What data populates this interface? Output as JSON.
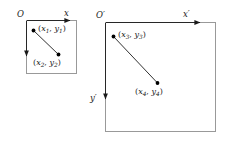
{
  "diagram": {
    "type": "geometry-coordinate-systems",
    "background_color": "#ffffff",
    "stroke_color": "#808080",
    "line_color": "#1a1a1a",
    "point_color": "#000000",
    "frames": [
      {
        "id": "left-frame",
        "origin_label": "O",
        "x_axis_label": "x",
        "y_axis_label": "",
        "points": [
          {
            "id": "p1",
            "label_open": "(",
            "label_x": "x",
            "label_x_sub": "1",
            "label_comma": ", ",
            "label_y": "y",
            "label_y_sub": "1",
            "label_close": ")"
          },
          {
            "id": "p2",
            "label_open": "(",
            "label_x": "x",
            "label_x_sub": "2",
            "label_comma": ", ",
            "label_y": "y",
            "label_y_sub": "2",
            "label_close": ")"
          }
        ]
      },
      {
        "id": "right-frame",
        "origin_label": "O",
        "origin_prime": "′",
        "x_axis_label": "x",
        "x_axis_prime": "′",
        "y_axis_label": "y",
        "y_axis_prime": "′",
        "points": [
          {
            "id": "p3",
            "label_open": "(",
            "label_x": "x",
            "label_x_sub": "3",
            "label_comma": ", ",
            "label_y": "y",
            "label_y_sub": "3",
            "label_close": ")"
          },
          {
            "id": "p4",
            "label_open": "(",
            "label_x": "x",
            "label_x_sub": "4",
            "label_comma": ", ",
            "label_y": "y",
            "label_y_sub": "4",
            "label_close": ")"
          }
        ]
      }
    ]
  },
  "geometry": {
    "left_box": {
      "x": 26,
      "y": 20,
      "w": 51,
      "h": 54
    },
    "right_box": {
      "x": 105,
      "y": 22,
      "w": 111,
      "h": 110
    },
    "left_p1": {
      "x": 33.5,
      "y": 30.5
    },
    "left_p2": {
      "x": 58.5,
      "y": 54.5
    },
    "right_p3": {
      "x": 113.5,
      "y": 36.5
    },
    "right_p4": {
      "x": 157.5,
      "y": 83.0
    }
  }
}
